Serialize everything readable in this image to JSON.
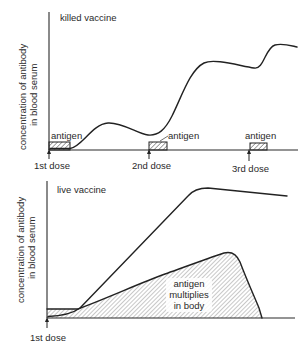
{
  "diagram": {
    "colors": {
      "ink": "#222222",
      "background": "#ffffff"
    },
    "top_panel": {
      "title": "killed vaccine",
      "y_axis_label_line1": "concentration of antibody",
      "y_axis_label_line2": "in blood serum",
      "doses": [
        {
          "label": "1st dose",
          "antigen_label": "antigen"
        },
        {
          "label": "2nd dose",
          "antigen_label": "antigen"
        },
        {
          "label": "3rd dose",
          "antigen_label": "antigen"
        }
      ],
      "curve_description": "antibody rises slightly after 1st dose, dips, rises steeply after 2nd dose, dips slightly, rises again after 3rd dose to highest level"
    },
    "bottom_panel": {
      "title": "live vaccine",
      "y_axis_label_line1": "concentration of antibody",
      "y_axis_label_line2": "in blood serum",
      "doses": [
        {
          "label": "1st dose"
        }
      ],
      "antigen_region_label_line1": "antigen",
      "antigen_region_label_line2": "multiplies",
      "antigen_region_label_line3": "in body",
      "curve_description": "single dose; antigen multiplies in body then drops to zero; antibody rises steadily to a high plateau that slowly declines"
    }
  }
}
